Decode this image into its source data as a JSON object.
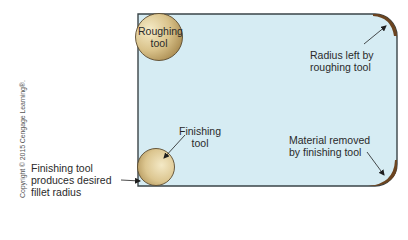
{
  "diagram": {
    "type": "machining fillet radius illustration",
    "colors": {
      "workpiece_fill": "#d6ecf3",
      "workpiece_stroke": "#3a4448",
      "tool_light": "#f3e7bf",
      "tool_dark": "#a88a4a",
      "tool_stroke": "#5a4a2e",
      "removed_material": "#6b4420",
      "arrow": "#1e1e1e",
      "text": "#2a2a2a"
    },
    "labels": {
      "roughing_tool": [
        "Roughing",
        "tool"
      ],
      "radius_left": [
        "Radius left by",
        "roughing tool"
      ],
      "finishing_tool": [
        "Finishing",
        "tool"
      ],
      "material_removed": [
        "Material removed",
        "by finishing tool"
      ],
      "finishing_desc": [
        "Finishing tool",
        "produces desired",
        "fillet radius"
      ]
    },
    "copyright": "Copyright © 2015 Cengage Learning®."
  }
}
